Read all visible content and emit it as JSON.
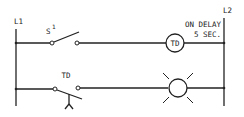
{
  "diagram": {
    "type": "ladder-logic",
    "rails": {
      "left": "L1",
      "right": "L2"
    },
    "rungs": [
      {
        "components": [
          {
            "type": "switch-normally-open",
            "label": "S",
            "superscript": "1"
          },
          {
            "type": "timer-coil",
            "label": "TD",
            "annotation_line1": "ON DELAY",
            "annotation_line2": "5 SEC."
          }
        ]
      },
      {
        "components": [
          {
            "type": "timed-contact-normally-open",
            "label": "TD"
          },
          {
            "type": "pilot-light",
            "label": ""
          }
        ]
      }
    ]
  },
  "colors": {
    "line": "#222222",
    "background": "#ffffff"
  }
}
